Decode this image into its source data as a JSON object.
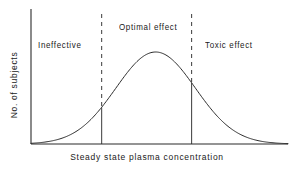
{
  "chart_data": {
    "type": "line",
    "title": "",
    "xlabel": "Steady state plasma concentration",
    "ylabel": "No. of subjects",
    "xlim": [
      0,
      100
    ],
    "ylim": [
      0,
      100
    ],
    "grid": false,
    "legend": "none",
    "axis_ticks": {
      "x": [],
      "y": []
    },
    "series": [
      {
        "name": "Distribution of subjects",
        "shape": "gaussian",
        "peak_x": 48.5,
        "peak_y": 92,
        "sigma": 15.5,
        "x": [
          0,
          4,
          8,
          12,
          16,
          20,
          24,
          28,
          32,
          36,
          40,
          44,
          48,
          52,
          56,
          60,
          64,
          68,
          72,
          76,
          80,
          84,
          88,
          92,
          96,
          100
        ],
        "y": [
          0.4,
          0.9,
          1.9,
          3.7,
          6.7,
          11.4,
          18.2,
          27.3,
          38.6,
          51.2,
          64.0,
          75.5,
          84.6,
          90.4,
          92.0,
          89.4,
          82.8,
          73.0,
          61.1,
          48.4,
          36.2,
          25.6,
          17.1,
          10.8,
          6.4,
          3.6
        ]
      }
    ],
    "dividers": [
      {
        "label": "lower-threshold",
        "x": 27.5,
        "style": "dashed-above-curve-solid-below"
      },
      {
        "label": "upper-threshold",
        "x": 62.5,
        "style": "dashed-above-curve-solid-below"
      }
    ],
    "regions": [
      {
        "id": "ineffective",
        "label": "Ineffective",
        "from_x": 0,
        "to_x": 27.5
      },
      {
        "id": "optimal",
        "label": "Optimal effect",
        "from_x": 27.5,
        "to_x": 62.5
      },
      {
        "id": "toxic",
        "label": "Toxic effect",
        "from_x": 62.5,
        "to_x": 100
      }
    ],
    "colors": {
      "curve": "#2b2b2b",
      "axis": "#2b2b2b",
      "divider": "#3a3a3a",
      "text": "#1a1a1a",
      "background": "#ffffff"
    }
  },
  "axes": {
    "x_title": "Steady state plasma concentration",
    "y_title": "No. of subjects"
  },
  "regions": {
    "ineffective": "Ineffective",
    "optimal": "Optimal effect",
    "toxic": "Toxic effect"
  }
}
